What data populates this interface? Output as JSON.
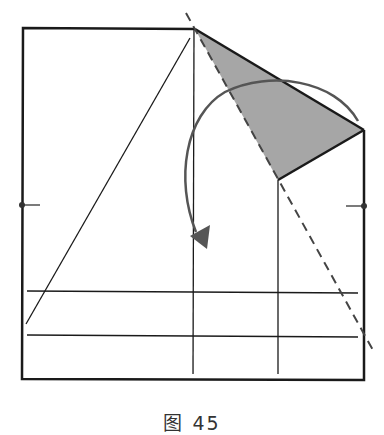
{
  "figure": {
    "caption": "图 45",
    "colors": {
      "line": "#1a1a1a",
      "shade": "#a6a6a6",
      "arrow": "#555555",
      "background": "#ffffff"
    },
    "elements": {
      "square": "paper outline",
      "shaded_flap": "gray triangular flap",
      "dashed_line": "valley fold line",
      "fold_arrow": "curved fold direction arrow",
      "vertical_creases": 2,
      "horizontal_creases": 2,
      "side_markers": 2
    }
  }
}
